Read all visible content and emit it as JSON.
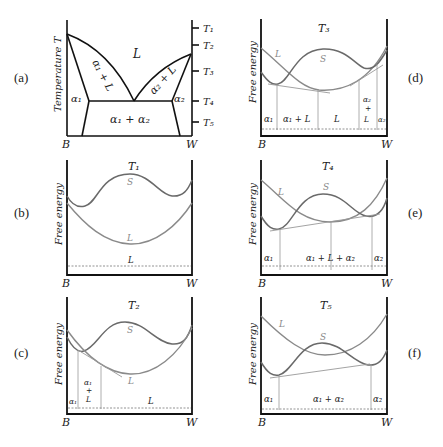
{
  "figure": {
    "panels": {
      "a": {
        "label": "(a)",
        "ylabel": "Temperature T",
        "x_left": "B",
        "x_right": "W",
        "regions": {
          "L": "L",
          "a1L": "α₁ + L",
          "a2L": "α₂ + L",
          "a1": "α₁",
          "a2": "α₂",
          "a1a2": "α₁ + α₂"
        },
        "temperature_ticks": [
          "T1",
          "T2",
          "T3",
          "T4",
          "T5"
        ]
      },
      "b": {
        "label": "(b)",
        "title": "T1",
        "ylabel": "Free energy",
        "x_left": "B",
        "x_right": "W",
        "curve_S": "S",
        "curve_L": "L",
        "ranges": [
          "L"
        ]
      },
      "c": {
        "label": "(c)",
        "title": "T2",
        "ylabel": "Free energy",
        "x_left": "B",
        "x_right": "W",
        "curve_S": "S",
        "curve_L": "L",
        "ranges": [
          "α₁",
          "α₁ + L",
          "L"
        ]
      },
      "d": {
        "label": "(d)",
        "title": "T3",
        "ylabel": "Free energy",
        "x_left": "B",
        "x_right": "W",
        "curve_S": "S",
        "curve_L": "L",
        "ranges": [
          "α₁",
          "α₁ + L",
          "L",
          "α₂ + L",
          "α₂"
        ]
      },
      "e": {
        "label": "(e)",
        "title": "T4",
        "ylabel": "Free energy",
        "x_left": "B",
        "x_right": "W",
        "curve_S": "S",
        "curve_L": "L",
        "ranges": [
          "α₁",
          "α₁ + L + α₂",
          "α₂"
        ]
      },
      "f": {
        "label": "(f)",
        "title": "T5",
        "ylabel": "Free energy",
        "x_left": "B",
        "x_right": "W",
        "curve_S": "S",
        "curve_L": "L",
        "ranges": [
          "α₁",
          "α₁ + α₂",
          "α₂"
        ]
      }
    },
    "colors": {
      "axis": "#111111",
      "solid_curve": "#6a6a6a",
      "liquid_curve": "#8a8a8a",
      "tangent": "#999999"
    }
  }
}
